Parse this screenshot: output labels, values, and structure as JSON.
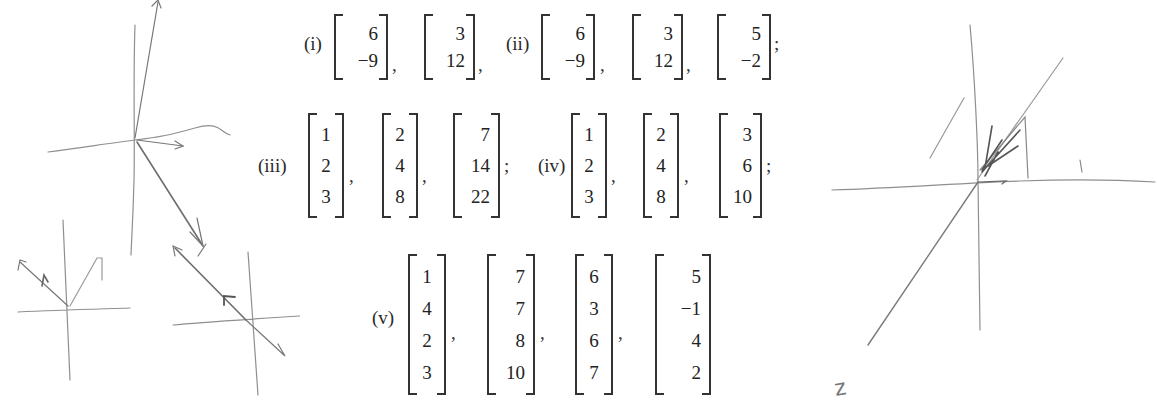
{
  "problems": [
    {
      "label": "(i)",
      "vectors": [
        [
          "6",
          "−9"
        ],
        [
          "3",
          "12"
        ]
      ],
      "separators": [
        ",",
        ","
      ]
    },
    {
      "label": "(ii)",
      "vectors": [
        [
          "6",
          "−9"
        ],
        [
          "3",
          "12"
        ],
        [
          "5",
          "−2"
        ]
      ],
      "separators": [
        ",",
        ",",
        ";"
      ]
    },
    {
      "label": "(iii)",
      "vectors": [
        [
          "1",
          "2",
          "3"
        ],
        [
          "2",
          "4",
          "8"
        ],
        [
          "7",
          "14",
          "22"
        ]
      ],
      "separators": [
        ",",
        ",",
        ";"
      ]
    },
    {
      "label": "(iv)",
      "vectors": [
        [
          "1",
          "2",
          "3"
        ],
        [
          "2",
          "4",
          "8"
        ],
        [
          "3",
          "6",
          "10"
        ]
      ],
      "separators": [
        ",",
        ",",
        ";"
      ]
    },
    {
      "label": "(v)",
      "vectors": [
        [
          "1",
          "4",
          "2",
          "3"
        ],
        [
          "7",
          "7",
          "8",
          "10"
        ],
        [
          "6",
          "3",
          "6",
          "7"
        ],
        [
          "5",
          "−1",
          "4",
          "2"
        ]
      ],
      "separators": [
        ",",
        ",",
        ","
      ]
    }
  ],
  "annotations": {
    "right_sketch_axis_label": "z"
  },
  "colors": {
    "ink": "#333333",
    "pencil": "#8a8a8a",
    "background": "#ffffff"
  }
}
